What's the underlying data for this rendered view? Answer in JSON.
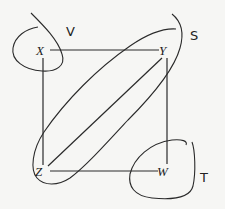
{
  "diagram": {
    "nodes": [
      {
        "id": "X",
        "label": "X",
        "x": 42,
        "y": 55
      },
      {
        "id": "Y",
        "label": "Y",
        "x": 164,
        "y": 55
      },
      {
        "id": "Z",
        "label": "Z",
        "x": 40,
        "y": 176
      },
      {
        "id": "W",
        "label": "W",
        "x": 163,
        "y": 176
      }
    ],
    "edges": [
      {
        "from": "X",
        "to": "Y"
      },
      {
        "from": "X",
        "to": "Z"
      },
      {
        "from": "Y",
        "to": "W"
      },
      {
        "from": "Z",
        "to": "W"
      },
      {
        "from": "Z",
        "to": "Y"
      }
    ],
    "regions": [
      {
        "id": "V",
        "label": "V",
        "x": 70,
        "y": 36,
        "encloses": [
          "X"
        ]
      },
      {
        "id": "S",
        "label": "S",
        "x": 194,
        "y": 40,
        "encloses": [
          "Y",
          "Z",
          "Z-Y edge"
        ]
      },
      {
        "id": "T",
        "label": "T",
        "x": 203,
        "y": 180,
        "encloses": [
          "W"
        ]
      }
    ],
    "stroke_color": "#2a2a2a",
    "background_color": "#f6f6f4"
  }
}
